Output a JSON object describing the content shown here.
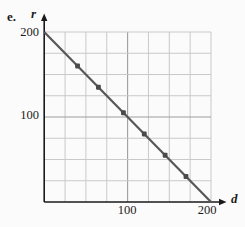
{
  "labels": {
    "item": "e."
  },
  "chart_data": {
    "type": "scatter",
    "xlabel": "d",
    "ylabel": "r",
    "xlim": [
      0,
      200
    ],
    "ylim": [
      0,
      200
    ],
    "grid_step": 25,
    "grid": true,
    "major_grid_at": [
      100
    ],
    "x_tick_labels": [
      "100",
      "200"
    ],
    "y_tick_labels": [
      "100",
      "200"
    ],
    "line": {
      "from": [
        0,
        200
      ],
      "to": [
        200,
        0
      ]
    },
    "points": [
      [
        40,
        160
      ],
      [
        65,
        135
      ],
      [
        95,
        105
      ],
      [
        120,
        80
      ],
      [
        145,
        55
      ],
      [
        170,
        30
      ]
    ],
    "colors": {
      "grid": "#c9c9c9",
      "major_grid": "#9e9e9e",
      "axis": "#1a1a1a",
      "line": "#575757",
      "point": "#4a4a4a"
    }
  }
}
